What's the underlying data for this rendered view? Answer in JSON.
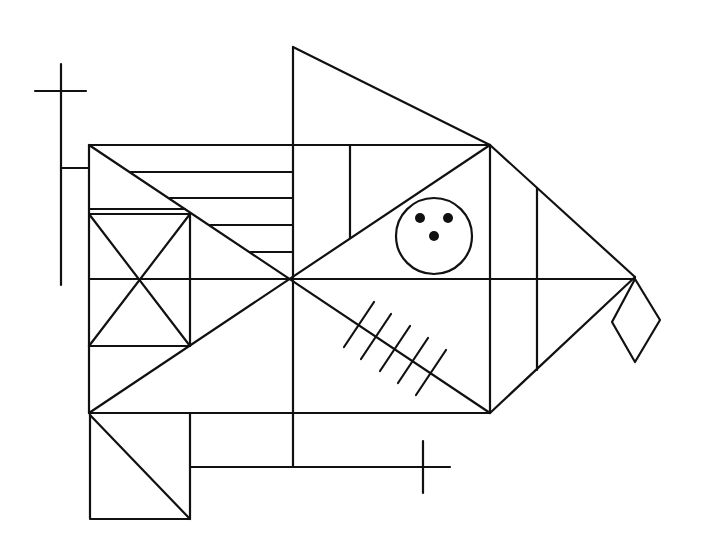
{
  "figure": {
    "stroke_color": "#111111",
    "background_color": "#ffffff",
    "components": [
      "left-cross",
      "main-rectangle",
      "rectangle-diagonals",
      "rectangle-midlines",
      "upper-left-parallel-lines",
      "upper-left-small-square-with-x",
      "top-triangle",
      "upper-right-vertical-line",
      "circle-with-three-dots",
      "right-triangle",
      "right-triangle-vertical-line",
      "diamond",
      "hatch-marks-five",
      "bottom-left-square-with-diagonal",
      "bottom-horizontal-line",
      "bottom-right-cross"
    ],
    "hatch_mark_count": 5,
    "dot_count": 3,
    "parallel_line_count": 4
  }
}
